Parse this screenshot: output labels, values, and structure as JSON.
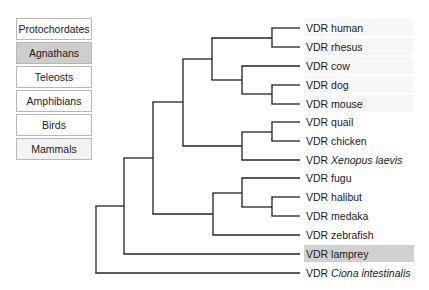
{
  "legend": [
    {
      "label": "Protochordates",
      "fill": "#ffffff"
    },
    {
      "label": "Agnathans",
      "fill": "#cdcdcd"
    },
    {
      "label": "Teleosts",
      "fill": "#ffffff"
    },
    {
      "label": "Amphibians",
      "fill": "#ffffff"
    },
    {
      "label": "Birds",
      "fill": "#ffffff"
    },
    {
      "label": "Mammals",
      "fill": "#f3f3f3"
    }
  ],
  "tree": {
    "leaves": [
      {
        "prefix": "VDR",
        "name": "human",
        "italic": false,
        "y": 28,
        "highlight": "#f7f7f8"
      },
      {
        "prefix": "VDR",
        "name": "rhesus",
        "italic": false,
        "y": 47,
        "highlight": "#f7f7f8"
      },
      {
        "prefix": "VDR",
        "name": "cow",
        "italic": false,
        "y": 66,
        "highlight": "#f7f7f8"
      },
      {
        "prefix": "VDR",
        "name": "dog",
        "italic": false,
        "y": 85,
        "highlight": "#f7f7f8"
      },
      {
        "prefix": "VDR",
        "name": "mouse",
        "italic": false,
        "y": 104,
        "highlight": "#f7f7f8"
      },
      {
        "prefix": "VDR",
        "name": "quail",
        "italic": false,
        "y": 122,
        "highlight": ""
      },
      {
        "prefix": "VDR",
        "name": "chicken",
        "italic": false,
        "y": 141,
        "highlight": ""
      },
      {
        "prefix": "VDR",
        "name": "Xenopus laevis",
        "italic": true,
        "y": 160,
        "highlight": ""
      },
      {
        "prefix": "VDR",
        "name": "fugu",
        "italic": false,
        "y": 178,
        "highlight": ""
      },
      {
        "prefix": "VDR",
        "name": "halibut",
        "italic": false,
        "y": 197,
        "highlight": ""
      },
      {
        "prefix": "VDR",
        "name": "medaka",
        "italic": false,
        "y": 216,
        "highlight": ""
      },
      {
        "prefix": "VDR",
        "name": "zebrafish",
        "italic": false,
        "y": 235,
        "highlight": ""
      },
      {
        "prefix": "VDR",
        "name": "lamprey",
        "italic": false,
        "y": 254,
        "highlight": "#d0d0d0"
      },
      {
        "prefix": "VDR",
        "name": "Ciona intestinalis",
        "italic": true,
        "y": 273,
        "highlight": ""
      }
    ],
    "leaf_x": 300,
    "label_x": 304,
    "nodes": [
      {
        "id": "human-rhesus",
        "x": 272,
        "y1": 28,
        "y2": 47
      },
      {
        "id": "dog-mouse",
        "x": 272,
        "y1": 85,
        "y2": 104
      },
      {
        "id": "cow-dogmouse",
        "x": 242,
        "y1": 66,
        "y2": 94
      },
      {
        "id": "mammals",
        "x": 212,
        "y1": 38,
        "y2": 80
      },
      {
        "id": "quail-chicken",
        "x": 272,
        "y1": 122,
        "y2": 141
      },
      {
        "id": "birds-xenopus",
        "x": 242,
        "y1": 132,
        "y2": 160
      },
      {
        "id": "tetrapods",
        "x": 183,
        "y1": 59,
        "y2": 146
      },
      {
        "id": "halibut-medaka",
        "x": 272,
        "y1": 197,
        "y2": 216
      },
      {
        "id": "fugu-hm",
        "x": 242,
        "y1": 178,
        "y2": 207
      },
      {
        "id": "teleosts",
        "x": 213,
        "y1": 193,
        "y2": 235
      },
      {
        "id": "gnathostomes",
        "x": 153,
        "y1": 102,
        "y2": 214
      },
      {
        "id": "vertebrates",
        "x": 124,
        "y1": 158,
        "y2": 254
      },
      {
        "id": "root",
        "x": 96,
        "y1": 206,
        "y2": 273
      }
    ],
    "edges": [
      {
        "x1": 272,
        "x2": 300,
        "y": 28
      },
      {
        "x1": 272,
        "x2": 300,
        "y": 47
      },
      {
        "x1": 242,
        "x2": 300,
        "y": 66
      },
      {
        "x1": 272,
        "x2": 300,
        "y": 85
      },
      {
        "x1": 272,
        "x2": 300,
        "y": 104
      },
      {
        "x1": 242,
        "x2": 272,
        "y": 94
      },
      {
        "x1": 212,
        "x2": 272,
        "y": 38
      },
      {
        "x1": 212,
        "x2": 242,
        "y": 80
      },
      {
        "x1": 183,
        "x2": 212,
        "y": 59
      },
      {
        "x1": 272,
        "x2": 300,
        "y": 122
      },
      {
        "x1": 272,
        "x2": 300,
        "y": 141
      },
      {
        "x1": 242,
        "x2": 272,
        "y": 132
      },
      {
        "x1": 242,
        "x2": 300,
        "y": 160
      },
      {
        "x1": 183,
        "x2": 242,
        "y": 146
      },
      {
        "x1": 153,
        "x2": 183,
        "y": 102
      },
      {
        "x1": 242,
        "x2": 300,
        "y": 178
      },
      {
        "x1": 272,
        "x2": 300,
        "y": 197
      },
      {
        "x1": 272,
        "x2": 300,
        "y": 216
      },
      {
        "x1": 242,
        "x2": 272,
        "y": 207
      },
      {
        "x1": 213,
        "x2": 242,
        "y": 193
      },
      {
        "x1": 213,
        "x2": 300,
        "y": 235
      },
      {
        "x1": 153,
        "x2": 213,
        "y": 214
      },
      {
        "x1": 124,
        "x2": 153,
        "y": 158
      },
      {
        "x1": 124,
        "x2": 300,
        "y": 254
      },
      {
        "x1": 96,
        "x2": 124,
        "y": 206
      },
      {
        "x1": 96,
        "x2": 300,
        "y": 273
      }
    ]
  },
  "colors": {
    "branch": "#222222",
    "legend_border": "#b8b8b8",
    "agnathan_highlight": "#d0d0d0"
  }
}
